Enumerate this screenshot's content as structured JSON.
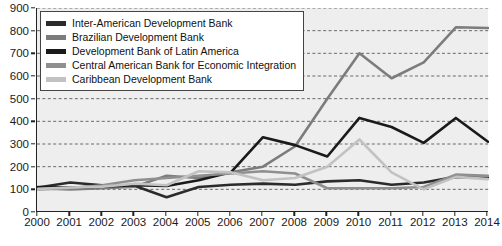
{
  "chart_data": {
    "type": "line",
    "title": "",
    "xlabel": "",
    "ylabel": "",
    "grid": true,
    "legend_position": "top-left",
    "xlim": [
      2000,
      2014
    ],
    "ylim": [
      0,
      900
    ],
    "ytick_step": 100,
    "categories": [
      2000,
      2001,
      2002,
      2003,
      2004,
      2005,
      2006,
      2007,
      2008,
      2009,
      2010,
      2011,
      2012,
      2013,
      2014
    ],
    "yticks": [
      0,
      100,
      200,
      300,
      400,
      500,
      600,
      700,
      800,
      900
    ],
    "xticks": [
      "2000",
      "2001",
      "2002",
      "2003",
      "2004",
      "2005",
      "2006",
      "2007",
      "2008",
      "2009",
      "2010",
      "2011",
      "2012",
      "2013",
      "2014"
    ],
    "series": [
      {
        "name": "Inter-American Development Bank",
        "color": "#2b2b2b",
        "values": [
          108,
          130,
          118,
          116,
          65,
          110,
          120,
          125,
          120,
          135,
          140,
          120,
          130,
          155,
          150
        ]
      },
      {
        "name": "Brazilian Development Bank",
        "color": "#7c7c7c",
        "values": [
          105,
          100,
          105,
          112,
          160,
          150,
          175,
          200,
          290,
          500,
          700,
          590,
          660,
          815,
          812
        ]
      },
      {
        "name": "Development Bank of Latin America",
        "color": "#1a1a1a",
        "values": [
          110,
          108,
          112,
          118,
          115,
          140,
          175,
          330,
          295,
          245,
          415,
          375,
          305,
          415,
          310
        ]
      },
      {
        "name": "Central American Bank for Economic Integration",
        "color": "#8f8f8f",
        "values": [
          100,
          105,
          118,
          140,
          150,
          160,
          170,
          180,
          170,
          105,
          105,
          105,
          110,
          165,
          160
        ]
      },
      {
        "name": "Caribbean Development Bank",
        "color": "#c2c2c2",
        "values": [
          102,
          108,
          112,
          125,
          118,
          180,
          175,
          140,
          150,
          200,
          320,
          175,
          100,
          155,
          145
        ]
      }
    ]
  },
  "legend": {
    "items": [
      {
        "label": "Inter-American Development Bank",
        "color": "#2b2b2b"
      },
      {
        "label": "Brazilian Development Bank",
        "color": "#7c7c7c"
      },
      {
        "label": "Development Bank of Latin America",
        "color": "#1a1a1a"
      },
      {
        "label": "Central American Bank for Economic Integration",
        "color": "#8f8f8f"
      },
      {
        "label": "Caribbean Development Bank",
        "color": "#c2c2c2"
      }
    ]
  }
}
